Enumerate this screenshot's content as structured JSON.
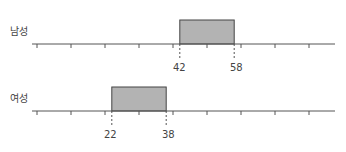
{
  "chart_data": {
    "type": "range-bar",
    "title": "",
    "xlabel": "",
    "ylabel": "",
    "xlim": [
      0,
      88
    ],
    "tick_step": 10,
    "tick_values": [
      0,
      10,
      20,
      30,
      40,
      50,
      60,
      70,
      80
    ],
    "grid": false,
    "bar_color": "#b3b3b3",
    "series": [
      {
        "name": "남성",
        "start": 42,
        "end": 58,
        "start_label": "42",
        "end_label": "58"
      },
      {
        "name": "여성",
        "start": 22,
        "end": 38,
        "start_label": "22",
        "end_label": "38"
      }
    ]
  }
}
